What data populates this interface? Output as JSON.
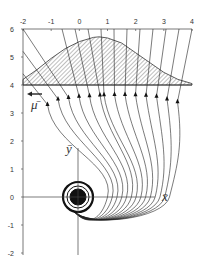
{
  "chart_data": {
    "type": "line",
    "title": "",
    "x_ticks": [
      "-2",
      "-1",
      "0",
      "1",
      "2",
      "3",
      "4"
    ],
    "y_ticks": [
      "6",
      "5",
      "4",
      "3",
      "2",
      "1",
      "0",
      "-1",
      "-2"
    ],
    "xlim": [
      -2,
      4
    ],
    "ylim": [
      -2,
      6
    ],
    "xlabel": "x̄",
    "ylabel": "ȳ",
    "flow_label": "μ̄",
    "annotations": {
      "hatched_region": "bell-shaped hatched region between y=4 and a curve peaking near (0.7, 5.7)",
      "arrow": "left-pointing arrow at y≈3.6 labeled μ̄",
      "spiral": "trajectories converge into a spiral around the origin"
    },
    "hatched_curve": {
      "x": [
        -2,
        -1.5,
        -1,
        -0.5,
        0,
        0.5,
        0.7,
        1,
        1.5,
        2,
        2.5,
        3,
        3.5,
        4
      ],
      "y": [
        4.2,
        4.55,
        4.95,
        5.3,
        5.55,
        5.7,
        5.72,
        5.68,
        5.5,
        5.15,
        4.8,
        4.45,
        4.2,
        4.05
      ]
    },
    "trajectory_count": 14,
    "arrowhead_positions_y": [
      3.3,
      3.5,
      3.55,
      3.6,
      3.62,
      3.64,
      3.65,
      3.66,
      3.66,
      3.65,
      3.63,
      3.6,
      3.5,
      3.4
    ]
  }
}
